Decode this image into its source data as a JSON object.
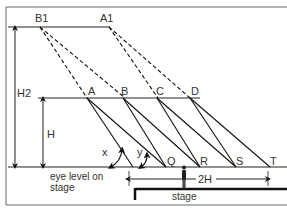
{
  "diagram": {
    "points_upper": [
      {
        "id": "B1",
        "label": "B1"
      },
      {
        "id": "A1",
        "label": "A1"
      }
    ],
    "points_middle": [
      {
        "id": "A",
        "label": "A"
      },
      {
        "id": "B",
        "label": "B"
      },
      {
        "id": "C",
        "label": "C"
      },
      {
        "id": "D",
        "label": "D"
      }
    ],
    "points_ground": [
      {
        "id": "Q",
        "label": "Q"
      },
      {
        "id": "R",
        "label": "R"
      },
      {
        "id": "S",
        "label": "S"
      },
      {
        "id": "T",
        "label": "T"
      }
    ],
    "dimensions": {
      "h2_label": "H2",
      "h_label": "H",
      "width_label": "2H"
    },
    "angles": {
      "x_label": "x",
      "y_label": "y"
    },
    "annotations": {
      "eye_level_line1": "eye level on",
      "eye_level_line2": "stage",
      "stage_label": "stage"
    },
    "colors": {
      "line": "#111111",
      "text": "#333333",
      "frame": "#555555"
    }
  }
}
